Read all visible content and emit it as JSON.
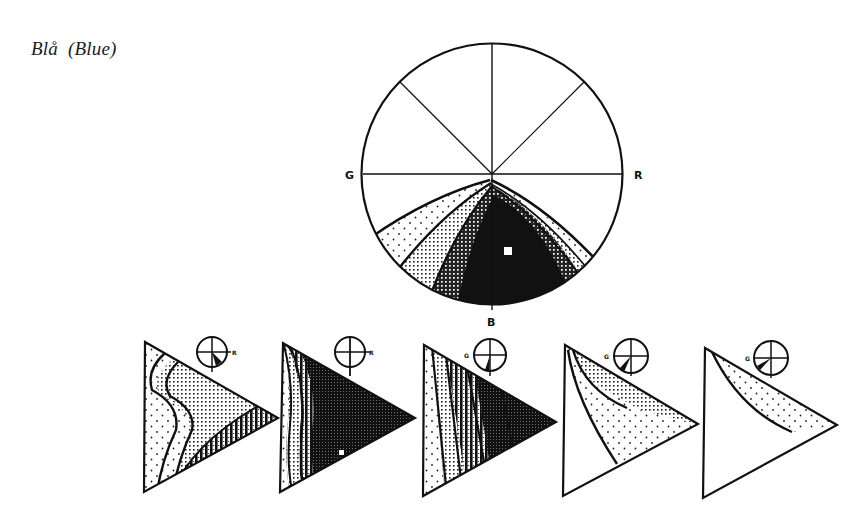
{
  "title": "Blå  (Blue)",
  "main_circle": {
    "labels": {
      "left": "G",
      "right": "R",
      "bottom": "B"
    },
    "center": [
      492,
      174
    ],
    "radius": 131,
    "bands": [
      {
        "name": "sparse-dots",
        "shade": "light"
      },
      {
        "name": "fine-dots",
        "shade": "medium-light"
      },
      {
        "name": "cross-hatch",
        "shade": "medium-dark"
      },
      {
        "name": "solid",
        "shade": "dark"
      }
    ],
    "marker": "white-square"
  },
  "triangles": [
    {
      "index": 1,
      "indicator_label": "R",
      "fill_level": "mixed-dark-bottom"
    },
    {
      "index": 2,
      "indicator_label": "R",
      "fill_level": "very-dark"
    },
    {
      "index": 3,
      "indicator_label": "G",
      "fill_level": "dark-right"
    },
    {
      "index": 4,
      "indicator_label": "G",
      "fill_level": "light-dots"
    },
    {
      "index": 5,
      "indicator_label": "G",
      "fill_level": "very-light"
    }
  ],
  "colors": {
    "ink": "#111111",
    "paper": "#ffffff"
  }
}
